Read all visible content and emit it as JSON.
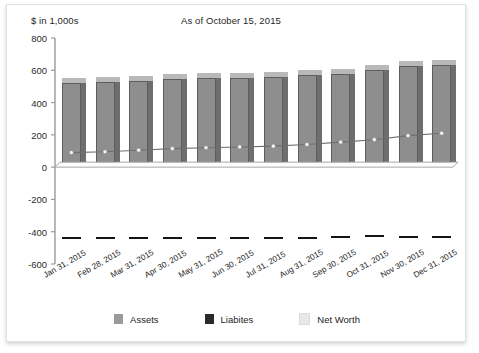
{
  "header": {
    "unit_label": "$ in 1,000s",
    "as_of_label": "As of October 15, 2015"
  },
  "legend": {
    "items": [
      {
        "label": "Assets",
        "color": "#9a9a9a",
        "name": "legend-assets"
      },
      {
        "label": "Liabites",
        "color": "#2a2a2a",
        "name": "legend-liabilities"
      },
      {
        "label": "Net Worth",
        "color": "#e8e8e8",
        "name": "legend-net-worth"
      }
    ]
  },
  "chart_data": {
    "type": "bar",
    "title": "As of October 15, 2015",
    "subtitle": "$ in 1,000s",
    "xlabel": "",
    "ylabel": "$ in 1,000s",
    "ylim": [
      -600,
      800
    ],
    "yticks": [
      800,
      600,
      400,
      200,
      0,
      -200,
      -400,
      -600
    ],
    "ytick_labels": [
      "800",
      "600",
      "400",
      "200",
      "0",
      "-200",
      "-400",
      "-600"
    ],
    "grid": false,
    "legend_position": "bottom",
    "categories": [
      "Jan 31, 2015",
      "Feb 28, 2015",
      "Mar 31, 2015",
      "Apr 30, 2015",
      "May 31, 2015",
      "Jun 30, 2015",
      "Jul 31, 2015",
      "Aug 31, 2015",
      "Sep 30, 2015",
      "Oct 31, 2015",
      "Nov 30, 2015",
      "Dec 31, 2015"
    ],
    "series": [
      {
        "name": "Assets",
        "type": "bar",
        "color": "#9a9a9a",
        "values": [
          520,
          525,
          535,
          545,
          550,
          555,
          560,
          570,
          580,
          600,
          625,
          635
        ]
      },
      {
        "name": "Liabites",
        "type": "bar",
        "color": "#2a2a2a",
        "values": [
          -430,
          -430,
          -430,
          -430,
          -430,
          -430,
          -430,
          -430,
          -425,
          -420,
          -425,
          -425
        ]
      },
      {
        "name": "Net Worth",
        "type": "line",
        "color": "#efefef",
        "values": [
          90,
          95,
          105,
          115,
          120,
          125,
          130,
          140,
          155,
          170,
          195,
          210
        ]
      }
    ]
  }
}
